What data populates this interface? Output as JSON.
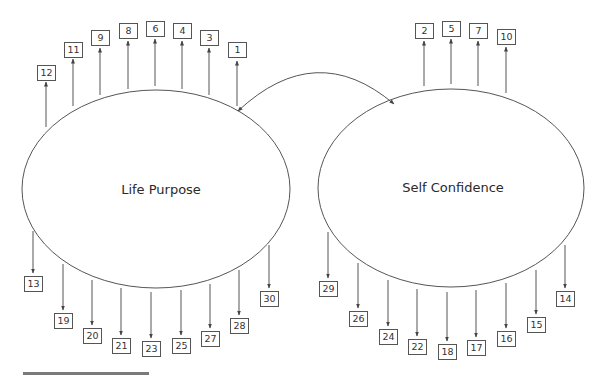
{
  "diagram": {
    "type": "structural-equation-model",
    "colors": {
      "stroke": "#555555",
      "text": "#2a2a2a",
      "bar": "#7a7a7a"
    },
    "latents": [
      {
        "id": "life_purpose",
        "label": "Life Purpose",
        "cx": 156,
        "cy": 189,
        "rx": 134,
        "ry": 99
      },
      {
        "id": "self_confidence",
        "label": "Self Confidence",
        "cx": 451,
        "cy": 188,
        "rx": 133,
        "ry": 99
      }
    ],
    "covariance": {
      "from": "life_purpose",
      "to": "self_confidence",
      "label": ""
    },
    "indicators": {
      "life_purpose": {
        "top": [
          {
            "label": "12",
            "x": 46,
            "box_y": 65,
            "arrow_from": 127,
            "arrow_to": 82
          },
          {
            "label": "11",
            "x": 73,
            "box_y": 42,
            "arrow_from": 106,
            "arrow_to": 59
          },
          {
            "label": "9",
            "x": 100,
            "box_y": 30,
            "arrow_from": 95,
            "arrow_to": 48
          },
          {
            "label": "8",
            "x": 128,
            "box_y": 23,
            "arrow_from": 89,
            "arrow_to": 41
          },
          {
            "label": "6",
            "x": 155,
            "box_y": 21,
            "arrow_from": 86,
            "arrow_to": 39
          },
          {
            "label": "4",
            "x": 182,
            "box_y": 23,
            "arrow_from": 89,
            "arrow_to": 41
          },
          {
            "label": "3",
            "x": 209,
            "box_y": 30,
            "arrow_from": 95,
            "arrow_to": 48
          },
          {
            "label": "1",
            "x": 237,
            "box_y": 42,
            "arrow_from": 106,
            "arrow_to": 61
          }
        ],
        "bottom": [
          {
            "label": "13",
            "x": 33,
            "box_y": 276,
            "arrow_from": 231,
            "arrow_to": 273
          },
          {
            "label": "19",
            "x": 63,
            "box_y": 313,
            "arrow_from": 264,
            "arrow_to": 310
          },
          {
            "label": "20",
            "x": 92,
            "box_y": 328,
            "arrow_from": 280,
            "arrow_to": 325
          },
          {
            "label": "21",
            "x": 121,
            "box_y": 338,
            "arrow_from": 288,
            "arrow_to": 335
          },
          {
            "label": "23",
            "x": 151,
            "box_y": 341,
            "arrow_from": 292,
            "arrow_to": 338
          },
          {
            "label": "25",
            "x": 181,
            "box_y": 338,
            "arrow_from": 290,
            "arrow_to": 335
          },
          {
            "label": "27",
            "x": 210,
            "box_y": 331,
            "arrow_from": 284,
            "arrow_to": 328
          },
          {
            "label": "28",
            "x": 239,
            "box_y": 318,
            "arrow_from": 270,
            "arrow_to": 315
          },
          {
            "label": "30",
            "x": 269,
            "box_y": 291,
            "arrow_from": 245,
            "arrow_to": 288
          }
        ]
      },
      "self_confidence": {
        "top": [
          {
            "label": "2",
            "x": 424,
            "box_y": 23,
            "arrow_from": 86,
            "arrow_to": 41
          },
          {
            "label": "5",
            "x": 451,
            "box_y": 21,
            "arrow_from": 84,
            "arrow_to": 39
          },
          {
            "label": "7",
            "x": 478,
            "box_y": 23,
            "arrow_from": 86,
            "arrow_to": 41
          },
          {
            "label": "10",
            "x": 506,
            "box_y": 29,
            "arrow_from": 93,
            "arrow_to": 47
          }
        ],
        "bottom": [
          {
            "label": "29",
            "x": 328,
            "box_y": 281,
            "arrow_from": 232,
            "arrow_to": 278
          },
          {
            "label": "26",
            "x": 358,
            "box_y": 311,
            "arrow_from": 263,
            "arrow_to": 308
          },
          {
            "label": "24",
            "x": 388,
            "box_y": 329,
            "arrow_from": 280,
            "arrow_to": 326
          },
          {
            "label": "22",
            "x": 417,
            "box_y": 339,
            "arrow_from": 289,
            "arrow_to": 336
          },
          {
            "label": "18",
            "x": 447,
            "box_y": 344,
            "arrow_from": 292,
            "arrow_to": 341
          },
          {
            "label": "17",
            "x": 476,
            "box_y": 340,
            "arrow_from": 290,
            "arrow_to": 337
          },
          {
            "label": "16",
            "x": 506,
            "box_y": 331,
            "arrow_from": 283,
            "arrow_to": 328
          },
          {
            "label": "15",
            "x": 536,
            "box_y": 317,
            "arrow_from": 270,
            "arrow_to": 314
          },
          {
            "label": "14",
            "x": 565,
            "box_y": 291,
            "arrow_from": 245,
            "arrow_to": 288
          }
        ]
      }
    }
  }
}
